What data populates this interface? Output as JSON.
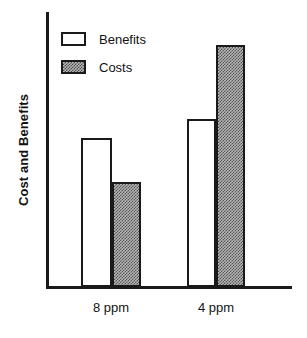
{
  "chart_data": {
    "type": "bar",
    "title": "",
    "subtitle": "",
    "xlabel": "",
    "ylabel": "Cost and Benefits",
    "categories": [
      "8 ppm",
      "4 ppm"
    ],
    "series": [
      {
        "name": "Benefits",
        "values": [
          54,
          61
        ],
        "fill": "white",
        "outline": "#1a1a1a"
      },
      {
        "name": "Costs",
        "values": [
          38,
          88
        ],
        "fill": "stipple-gray",
        "outline": "#1a1a1a"
      }
    ],
    "ylim": [
      0,
      100
    ],
    "y_axis_ticks_visible": false,
    "y_axis_values_labeled": false,
    "grid": false,
    "legend_position": "top-left",
    "bars_adjacent": true,
    "axis_color": "#1a1a1a",
    "background": "#ffffff"
  },
  "legend": {
    "items": [
      {
        "label": "Benefits",
        "swatch": "white-swatch"
      },
      {
        "label": "Costs",
        "swatch": "stipple-swatch"
      }
    ]
  },
  "axes": {
    "y_title": "Cost and Benefits",
    "x_tick_labels": [
      "8 ppm",
      "4 ppm"
    ]
  }
}
